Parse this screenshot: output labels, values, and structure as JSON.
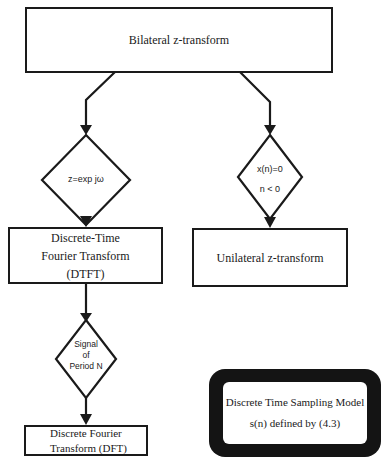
{
  "diagram": {
    "top_box": {
      "label": "Bilateral z-transform"
    },
    "left_decision": {
      "label": "z=exp jω"
    },
    "right_decision": {
      "line1": "x(n)=0",
      "line2": "n < 0"
    },
    "dtft_box": {
      "line1": "Discrete-Time",
      "line2": "Fourier Transform",
      "line3": "(DTFT)"
    },
    "unilateral_box": {
      "label": "Unilateral z-transform"
    },
    "period_decision": {
      "line1": "Signal",
      "line2": "of",
      "line3": "Period N"
    },
    "dft_box": {
      "line1": "Discrete Fourier",
      "line2": "Transform (DFT)"
    },
    "sampling_model": {
      "line1": "Discrete Time Sampling Model",
      "line2": "s(n) defined by (4.3)"
    },
    "colors": {
      "stroke": "#1a1a1a",
      "background": "#ffffff"
    }
  }
}
